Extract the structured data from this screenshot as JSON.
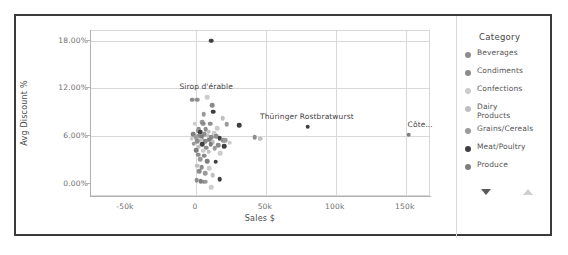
{
  "chart_data": {
    "type": "scatter",
    "title": "",
    "xlabel": "Sales $",
    "ylabel": "Avg Discount %",
    "xlim": [
      -75000,
      168000
    ],
    "ylim": [
      -1.6,
      19.2
    ],
    "xticks": [
      "-50k",
      "0",
      "50k",
      "100k",
      "150k"
    ],
    "xtick_values": [
      -50000,
      0,
      50000,
      100000,
      150000
    ],
    "yticks": [
      "0.00%",
      "6.00%",
      "12.00%",
      "18.00%"
    ],
    "ytick_values": [
      0,
      6,
      12,
      18
    ],
    "grid": "both",
    "legend_position": "right",
    "legend_title": "Category",
    "series": [
      {
        "name": "Beverages",
        "color": "#8d8d8d"
      },
      {
        "name": "Condiments",
        "color": "#8a8a8a"
      },
      {
        "name": "Confections",
        "color": "#cccccc"
      },
      {
        "name": "Dairy Products",
        "color": "#bfbfbf"
      },
      {
        "name": "Grains/Cereals",
        "color": "#9a9a9a"
      },
      {
        "name": "Meat/Poultry",
        "color": "#3f3f3f"
      },
      {
        "name": "Produce",
        "color": "#7e7e7e"
      }
    ],
    "annotations": [
      {
        "label": "Sirop d'érable",
        "x": 8000,
        "y": 11.1,
        "align": "center"
      },
      {
        "label": "Thüringer Rostbratwurst",
        "x": 80000,
        "y": 7.3,
        "align": "center"
      },
      {
        "label": "Côte...",
        "x": 152000,
        "y": 6.3,
        "align": "left"
      }
    ],
    "points": [
      {
        "x": 11000,
        "y": 18.0,
        "s": "Meat/Poultry"
      },
      {
        "x": 8000,
        "y": 10.9,
        "s": "Confections"
      },
      {
        "x": -2500,
        "y": 10.6,
        "s": "Beverages"
      },
      {
        "x": 1000,
        "y": 10.6,
        "s": "Beverages"
      },
      {
        "x": 11500,
        "y": 9.9,
        "s": "Condiments"
      },
      {
        "x": 12500,
        "y": 9.1,
        "s": "Meat/Poultry"
      },
      {
        "x": 5500,
        "y": 8.8,
        "s": "Grains/Cereals"
      },
      {
        "x": 19000,
        "y": 8.3,
        "s": "Dairy Products"
      },
      {
        "x": 4500,
        "y": 7.8,
        "s": "Grains/Cereals"
      },
      {
        "x": 5000,
        "y": 7.6,
        "s": "Condiments"
      },
      {
        "x": -1000,
        "y": 7.6,
        "s": "Confections"
      },
      {
        "x": 10000,
        "y": 7.6,
        "s": "Beverages"
      },
      {
        "x": 22000,
        "y": 7.5,
        "s": "Grains/Cereals"
      },
      {
        "x": 31000,
        "y": 7.4,
        "s": "Meat/Poultry"
      },
      {
        "x": 80000,
        "y": 7.2,
        "s": "Meat/Poultry"
      },
      {
        "x": 15000,
        "y": 7.0,
        "s": "Confections"
      },
      {
        "x": 2000,
        "y": 6.9,
        "s": "Condiments"
      },
      {
        "x": 7000,
        "y": 6.9,
        "s": "Beverages"
      },
      {
        "x": 1500,
        "y": 6.7,
        "s": "Grains/Cereals"
      },
      {
        "x": 9000,
        "y": 6.6,
        "s": "Dairy Products"
      },
      {
        "x": 3000,
        "y": 6.5,
        "s": "Meat/Poultry"
      },
      {
        "x": 13000,
        "y": 6.4,
        "s": "Confections"
      },
      {
        "x": -2000,
        "y": 6.3,
        "s": "Produce"
      },
      {
        "x": 6000,
        "y": 6.3,
        "s": "Beverages"
      },
      {
        "x": 152000,
        "y": 6.2,
        "s": "Produce"
      },
      {
        "x": 2500,
        "y": 6.1,
        "s": "Condiments"
      },
      {
        "x": 8500,
        "y": 6.1,
        "s": "Dairy Products"
      },
      {
        "x": 14500,
        "y": 6.0,
        "s": "Beverages"
      },
      {
        "x": 0,
        "y": 5.9,
        "s": "Grains/Cereals"
      },
      {
        "x": 4000,
        "y": 5.9,
        "s": "Produce"
      },
      {
        "x": 11000,
        "y": 5.9,
        "s": "Condiments"
      },
      {
        "x": 17000,
        "y": 5.8,
        "s": "Meat/Poultry"
      },
      {
        "x": 42000,
        "y": 5.9,
        "s": "Beverages"
      },
      {
        "x": 46000,
        "y": 5.7,
        "s": "Dairy Products"
      },
      {
        "x": -3000,
        "y": 5.7,
        "s": "Confections"
      },
      {
        "x": 3500,
        "y": 5.6,
        "s": "Dairy Products"
      },
      {
        "x": 9500,
        "y": 5.6,
        "s": "Produce"
      },
      {
        "x": 19500,
        "y": 5.5,
        "s": "Beverages"
      },
      {
        "x": 21000,
        "y": 5.5,
        "s": "Grains/Cereals"
      },
      {
        "x": 1000,
        "y": 5.4,
        "s": "Beverages"
      },
      {
        "x": 6500,
        "y": 5.4,
        "s": "Condiments"
      },
      {
        "x": 12000,
        "y": 5.3,
        "s": "Dairy Products"
      },
      {
        "x": 24000,
        "y": 5.2,
        "s": "Confections"
      },
      {
        "x": -1500,
        "y": 5.1,
        "s": "Grains/Cereals"
      },
      {
        "x": 4500,
        "y": 5.0,
        "s": "Meat/Poultry"
      },
      {
        "x": 10500,
        "y": 5.0,
        "s": "Produce"
      },
      {
        "x": 16000,
        "y": 4.9,
        "s": "Condiments"
      },
      {
        "x": 20000,
        "y": 4.8,
        "s": "Meat/Poultry"
      },
      {
        "x": 2000,
        "y": 4.7,
        "s": "Dairy Products"
      },
      {
        "x": 7500,
        "y": 4.6,
        "s": "Beverages"
      },
      {
        "x": 13500,
        "y": 4.5,
        "s": "Grains/Cereals"
      },
      {
        "x": 0,
        "y": 4.3,
        "s": "Produce"
      },
      {
        "x": 5000,
        "y": 4.2,
        "s": "Confections"
      },
      {
        "x": 9000,
        "y": 4.1,
        "s": "Dairy Products"
      },
      {
        "x": 17500,
        "y": 3.9,
        "s": "Confections"
      },
      {
        "x": 1500,
        "y": 3.7,
        "s": "Beverages"
      },
      {
        "x": 6000,
        "y": 3.6,
        "s": "Condiments"
      },
      {
        "x": 3000,
        "y": 3.1,
        "s": "Grains/Cereals"
      },
      {
        "x": 8000,
        "y": 2.9,
        "s": "Produce"
      },
      {
        "x": 14000,
        "y": 2.8,
        "s": "Meat/Poultry"
      },
      {
        "x": 1000,
        "y": 2.3,
        "s": "Dairy Products"
      },
      {
        "x": 4000,
        "y": 2.1,
        "s": "Beverages"
      },
      {
        "x": 9500,
        "y": 2.0,
        "s": "Confections"
      },
      {
        "x": 2500,
        "y": 1.6,
        "s": "Condiments"
      },
      {
        "x": 6500,
        "y": 1.4,
        "s": "Grains/Cereals"
      },
      {
        "x": 12000,
        "y": 1.1,
        "s": "Dairy Products"
      },
      {
        "x": 500,
        "y": 0.5,
        "s": "Beverages"
      },
      {
        "x": 3500,
        "y": 0.4,
        "s": "Produce"
      },
      {
        "x": 5500,
        "y": 0.3,
        "s": "Condiments"
      },
      {
        "x": 7000,
        "y": 0.3,
        "s": "Grains/Cereals"
      },
      {
        "x": 11000,
        "y": -0.4,
        "s": "Confections"
      },
      {
        "x": 17000,
        "y": 0.6,
        "s": "Meat/Poultry"
      }
    ]
  },
  "legend": {
    "title": "Category",
    "items": [
      {
        "label": "Beverages",
        "color": "#8d8d8d"
      },
      {
        "label": "Condiments",
        "color": "#8a8a8a"
      },
      {
        "label": "Confections",
        "color": "#cccccc"
      },
      {
        "label": "Dairy Products",
        "color": "#bfbfbf"
      },
      {
        "label": "Grains/Cereals",
        "color": "#9a9a9a"
      },
      {
        "label": "Meat/Poultry",
        "color": "#3f3f3f"
      },
      {
        "label": "Produce",
        "color": "#7e7e7e"
      }
    ],
    "nav": {
      "prev_icon": "triangle-down-icon",
      "next_icon": "triangle-up-icon"
    }
  }
}
